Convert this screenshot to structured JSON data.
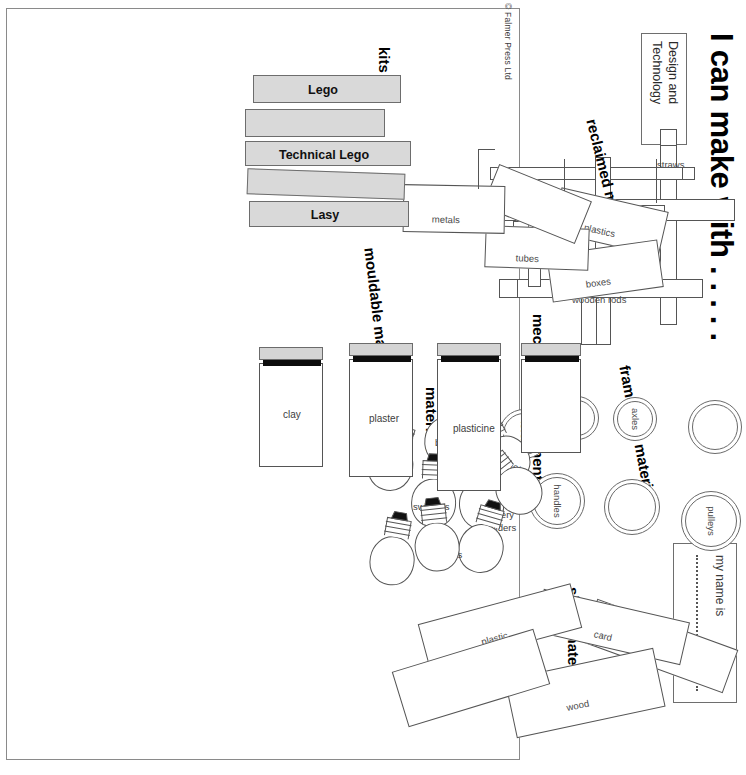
{
  "document": {
    "title": "I can make with . . . . .",
    "copyright": "© Falmer Press Ltd",
    "subject_box": "Design and Technology",
    "name_box_label": "my name is"
  },
  "sections": {
    "framework": {
      "heading": "framework materials",
      "items": [
        "straws",
        "wooden rods",
        "lolly sticks"
      ]
    },
    "mechanical": {
      "heading": "mechanical components",
      "items": [
        "pulleys",
        "axles",
        "gears",
        "levers",
        "handles"
      ],
      "blank_count": 2
    },
    "sheet": {
      "heading": "sheet materials",
      "items": [
        "paper",
        "card",
        "wood",
        "plastic"
      ]
    },
    "electrical": {
      "heading": "electrical\nmaterials",
      "heading_line1": "electrical",
      "heading_line2": "materials",
      "items": [
        "motors",
        "bulbs",
        "battery\nholders",
        "battery",
        "holders",
        "switches",
        "wires",
        "buzzers"
      ],
      "labels": [
        "motors",
        "bulbs",
        "battery",
        "holders",
        "switches",
        "wires",
        "buzzers"
      ],
      "bulb_count": 9
    },
    "reclaimed": {
      "heading": "reclaimed materials",
      "items": [
        "plastics",
        "boxes",
        "tubes",
        "metals"
      ]
    },
    "kits": {
      "heading": "kits",
      "items": [
        "Lego",
        "Technical Lego",
        "Lasy"
      ],
      "blank_count": 2
    },
    "mouldable": {
      "heading": "mouldable materials",
      "items": [
        "clay",
        "plaster",
        "plasticine"
      ]
    }
  },
  "colors": {
    "ink": "#000000",
    "outline": "#555555",
    "slab_fill": "#d9d9d9",
    "lid_grey": "#d4d4d4",
    "lid_black": "#0d0d0d",
    "label_text": "#4a4a4a",
    "border": "#8a8a8a"
  }
}
